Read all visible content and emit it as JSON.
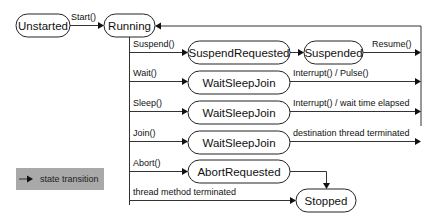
{
  "diagram": {
    "type": "state-machine",
    "states": {
      "unstarted": "Unstarted",
      "running": "Running",
      "suspend_requested": "SuspendRequested",
      "suspended": "Suspended",
      "wait_sleep_join_wait": "WaitSleepJoin",
      "wait_sleep_join_sleep": "WaitSleepJoin",
      "wait_sleep_join_join": "WaitSleepJoin",
      "abort_requested": "AbortRequested",
      "stopped": "Stopped"
    },
    "transitions": {
      "start": "Start()",
      "suspend": "Suspend()",
      "resume": "Resume()",
      "wait": "Wait()",
      "interrupt_pulse": "Interrupt() / Pulse()",
      "sleep": "Sleep()",
      "interrupt_elapsed": "Interrupt() / wait time elapsed",
      "join": "Join()",
      "dest_terminated": "destination thread terminated",
      "abort": "Abort()",
      "thread_terminated": "thread method terminated"
    },
    "legend": {
      "label": "state transition",
      "background": "#a9a9a9"
    }
  }
}
